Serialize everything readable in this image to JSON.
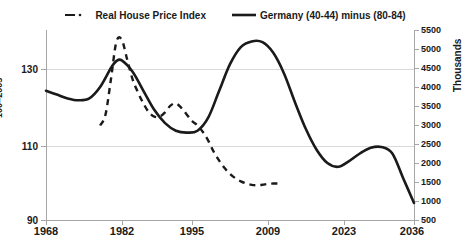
{
  "legend": {
    "items": [
      {
        "label": "Real House Price Index",
        "style": "dashed",
        "icon": "dashed-line-swatch"
      },
      {
        "label": "Germany (40-44) minus (80-84)",
        "style": "solid",
        "icon": "solid-line-swatch"
      }
    ]
  },
  "axes": {
    "left": {
      "title": "100=2005",
      "ticks": [
        "130",
        "110",
        "90"
      ],
      "min": 90,
      "max": 133.2
    },
    "right": {
      "title": "Thousands",
      "ticks": [
        "5500",
        "5000",
        "4500",
        "4000",
        "3500",
        "3000",
        "2500",
        "2000",
        "1500",
        "1000",
        "500"
      ],
      "min": 500,
      "max": 5500
    },
    "bottom": {
      "ticks": [
        "1968",
        "1982",
        "1995",
        "2009",
        "2023",
        "2036"
      ],
      "min": 1968,
      "max": 2036
    }
  },
  "colors": {
    "series": "#1a1a1a",
    "grid": "#d9d9d9",
    "axis": "#a6a6a6",
    "background": "#ffffff"
  },
  "chart_data": {
    "type": "line",
    "title": "",
    "xlabel": "",
    "ylabel": "100=2005",
    "y2label": "Thousands",
    "xlim": [
      1968,
      2036
    ],
    "ylim": [
      90,
      133.2
    ],
    "y2lim": [
      500,
      5500
    ],
    "grid": true,
    "legend_position": "top-center",
    "series": [
      {
        "name": "Real House Price Index",
        "axis": "left",
        "style": "dashed",
        "x": [
          1978,
          1979,
          1980,
          1981,
          1982,
          1983,
          1984,
          1985,
          1986,
          1987,
          1988,
          1989,
          1990,
          1991,
          1992,
          1993,
          1994,
          1995,
          1996,
          1997,
          1998,
          1999,
          2000,
          2001,
          2002,
          2003,
          2004,
          2005,
          2006,
          2007,
          2008,
          2009,
          2010,
          2011
        ],
        "y": [
          111.5,
          114.0,
          122.0,
          130.5,
          131.0,
          126.5,
          122.0,
          119.0,
          116.5,
          114.5,
          113.5,
          113.5,
          114.5,
          116.0,
          116.5,
          115.5,
          114.0,
          112.5,
          111.5,
          110.0,
          108.0,
          105.5,
          103.5,
          101.8,
          100.5,
          99.5,
          98.8,
          98.3,
          98.0,
          97.9,
          98.0,
          98.2,
          98.3,
          98.3
        ]
      },
      {
        "name": "Germany (40-44) minus (80-84)",
        "axis": "right",
        "style": "solid",
        "x": [
          1968,
          1970,
          1972,
          1974,
          1976,
          1978,
          1980,
          1981,
          1982,
          1984,
          1986,
          1988,
          1990,
          1992,
          1994,
          1996,
          1998,
          2000,
          2002,
          2004,
          2006,
          2008,
          2010,
          2012,
          2014,
          2016,
          2018,
          2020,
          2022,
          2024,
          2026,
          2028,
          2030,
          2032,
          2034,
          2036
        ],
        "y": [
          3900,
          3800,
          3700,
          3650,
          3700,
          4000,
          4500,
          4680,
          4700,
          4400,
          3900,
          3400,
          3050,
          2850,
          2800,
          2850,
          3200,
          3900,
          4600,
          5050,
          5200,
          5180,
          4900,
          4350,
          3600,
          2900,
          2350,
          2000,
          1900,
          2050,
          2250,
          2400,
          2420,
          2250,
          1600,
          950
        ]
      }
    ]
  }
}
